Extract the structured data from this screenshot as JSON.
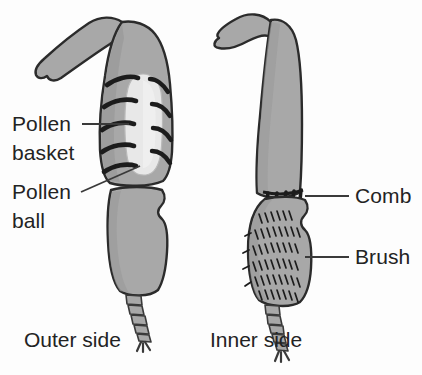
{
  "figure": {
    "background_color": "#fdfdfd",
    "limb_fill": "#a8a8a8",
    "limb_fill_shade": "#9b9b9b",
    "pollen_ball_fill": "#e8e8e8",
    "outline_color": "#2b2b2b",
    "bristle_color": "#1c1c1c",
    "text_color": "#232323",
    "leader_color": "#3a3a3a"
  },
  "labels": {
    "pollen_basket": {
      "line1": "Pollen",
      "line2": "basket"
    },
    "pollen_ball": {
      "line1": "Pollen",
      "line2": "ball"
    },
    "comb": "Comb",
    "brush": "Brush"
  },
  "captions": {
    "left": "Outer side",
    "right": "Inner side"
  },
  "parts": {
    "left_leg": {
      "name": "outer-side-hind-leg",
      "features": [
        "femur",
        "tibia",
        "pollen-basket",
        "pollen-ball",
        "basitarsus",
        "tarsus"
      ],
      "bristle_rows_left": 5,
      "bristle_rows_right": 4
    },
    "right_leg": {
      "name": "inner-side-hind-leg",
      "features": [
        "femur",
        "tibia",
        "comb",
        "basitarsus",
        "brush",
        "tarsus"
      ],
      "comb_teeth": 5,
      "brush_rows": 6
    }
  }
}
